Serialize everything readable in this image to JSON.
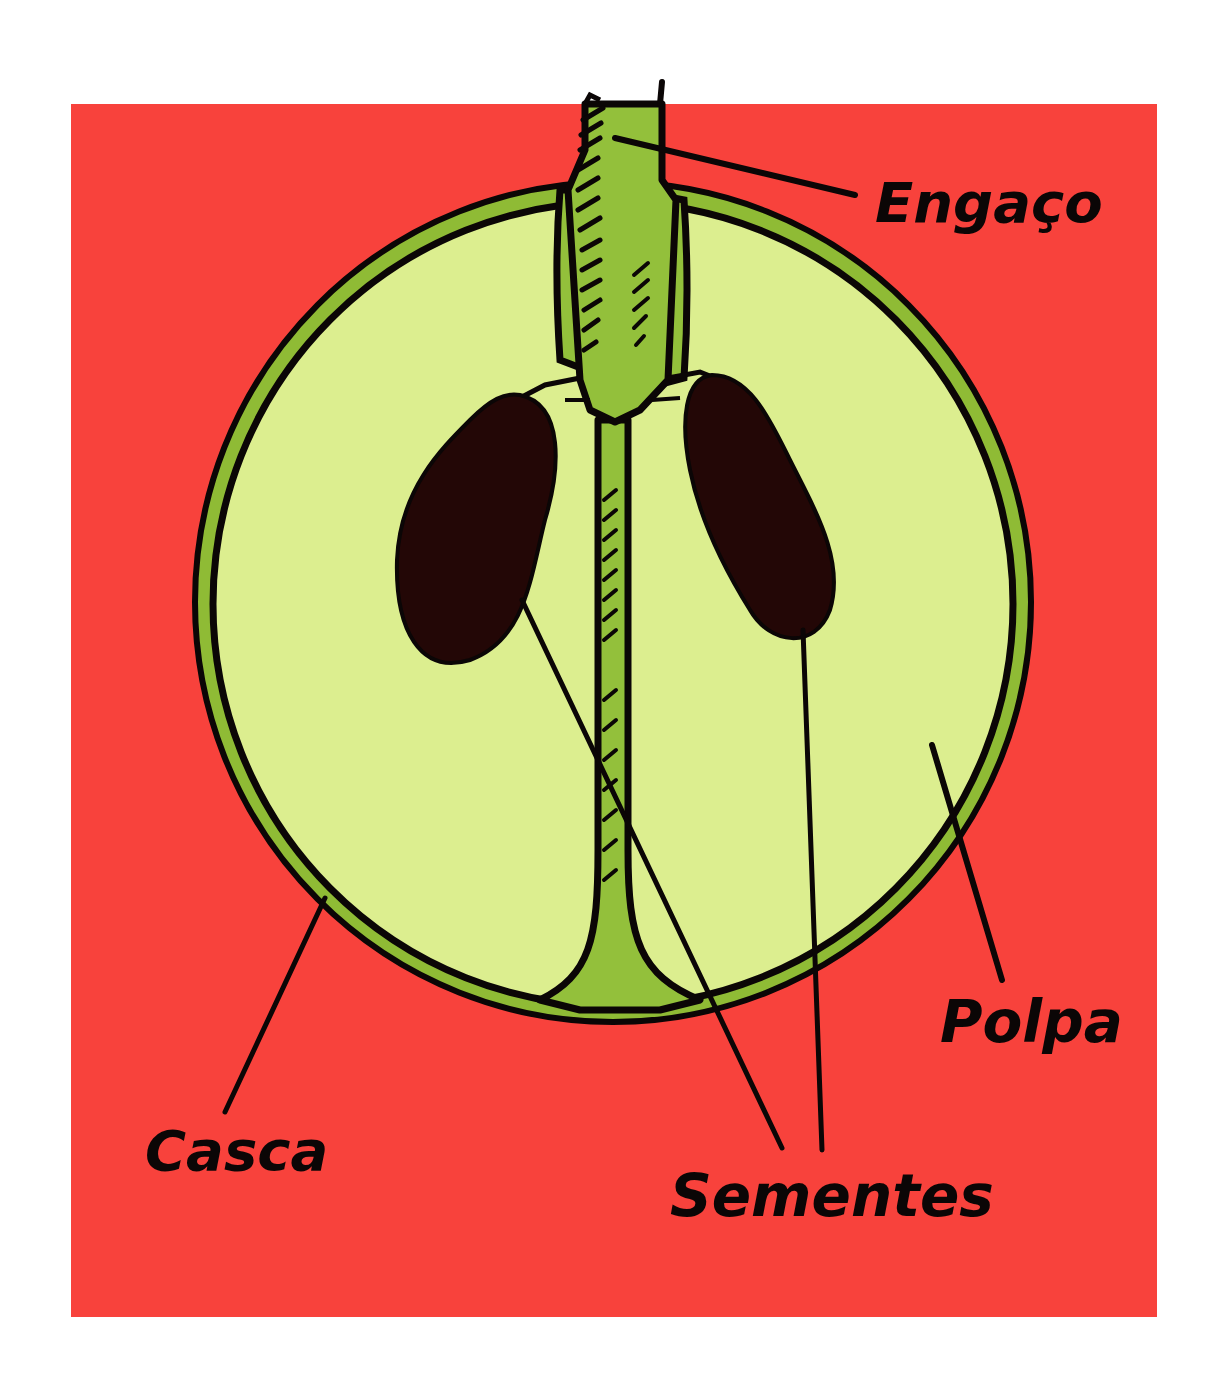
{
  "diagram": {
    "colors": {
      "background": "#ffffff",
      "panel": "#f8423c",
      "skin": "#8fbb35",
      "pulp": "#dcee8f",
      "stem": "#93c03b",
      "seed": "#230706",
      "ink": "#0b0606"
    },
    "labels": {
      "stem": "Engaço",
      "skin": "Casca",
      "seeds": "Sementes",
      "pulp": "Polpa"
    }
  }
}
